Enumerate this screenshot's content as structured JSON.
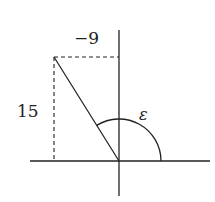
{
  "diagram": {
    "labels": {
      "x_component": "−9",
      "y_component": "15",
      "angle": "ε"
    },
    "vector": {
      "x": -9,
      "y": 15
    },
    "colors": {
      "stroke": "#222222",
      "background": "#ffffff"
    }
  }
}
